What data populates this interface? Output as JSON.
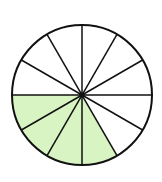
{
  "diagram": {
    "type": "fraction-circle",
    "total_slices": 12,
    "shaded_slices": 4,
    "shaded_start_deg": 180,
    "center": [
      82,
      95
    ],
    "radius": 70,
    "colors": {
      "shade": "#d8f4c2",
      "stroke": "#111111",
      "background": "#ffffff"
    }
  }
}
